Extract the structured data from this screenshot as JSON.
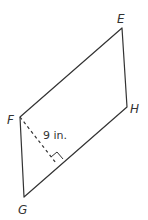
{
  "figure": {
    "shape": "parallelogram",
    "vertices": [
      "E",
      "H",
      "G",
      "F"
    ],
    "labels": {
      "E": "E",
      "F": "F",
      "G": "G",
      "H": "H"
    },
    "height_label": "9 in.",
    "height_from": "F",
    "height_to_side": "GH",
    "right_angle_marker": true,
    "line_color": "#333333"
  }
}
